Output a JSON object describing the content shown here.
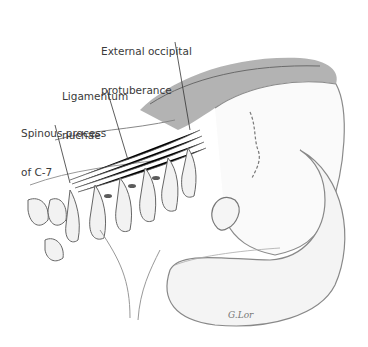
{
  "figure": {
    "labels": [
      {
        "id": "external-occipital-protuberance",
        "line1": "External occipital",
        "line2": "protuberance"
      },
      {
        "id": "ligamentum-nuchae",
        "line1": "Ligamentum",
        "line2": "nuchae"
      },
      {
        "id": "spinous-process-c7",
        "line1": "Spinous process",
        "line2": "of C-7"
      }
    ],
    "signature": "G.Lor",
    "colors": {
      "label_text": "#3a3a3a",
      "line": "#333333",
      "sketch_dark": "#444444",
      "sketch_mid": "#8a8a8a",
      "sketch_light": "#c8c8c8",
      "hair": "#7a7a7a"
    }
  }
}
